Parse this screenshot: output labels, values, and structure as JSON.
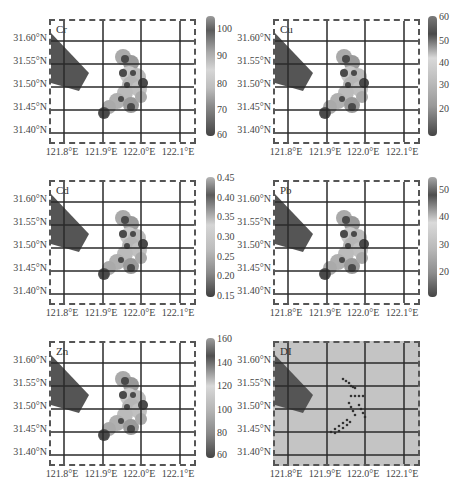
{
  "chart_data": [
    {
      "type": "heatmap",
      "panel_label": "Cr",
      "xlabel": "",
      "ylabel": "",
      "x_ticks": [
        "121.8°E",
        "121.9°E",
        "122.0°E",
        "122.1°E"
      ],
      "y_ticks": [
        "31.60°N",
        "31.55°N",
        "31.50°N",
        "31.45°N",
        "31.40°N"
      ],
      "colorbar": {
        "ticks": [
          "100",
          "90",
          "80",
          "70",
          "60"
        ],
        "range": [
          60,
          104
        ]
      }
    },
    {
      "type": "heatmap",
      "panel_label": "Cu",
      "x_ticks": [
        "121.8°E",
        "121.9°E",
        "122.0°E",
        "122.1°E"
      ],
      "y_ticks": [
        "31.60°N",
        "31.55°N",
        "31.50°N",
        "31.45°N",
        "31.40°N"
      ],
      "colorbar": {
        "ticks": [
          "60",
          "50",
          "40",
          "30",
          "20"
        ],
        "range": [
          15,
          60
        ]
      }
    },
    {
      "type": "heatmap",
      "panel_label": "Cd",
      "x_ticks": [
        "121.8°E",
        "121.9°E",
        "122.0°E",
        "122.1°E"
      ],
      "y_ticks": [
        "31.60°N",
        "31.55°N",
        "31.50°N",
        "31.45°N",
        "31.40°N"
      ],
      "colorbar": {
        "ticks": [
          "0.45",
          "0.40",
          "0.35",
          "0.30",
          "0.25",
          "0.20",
          "0.15"
        ],
        "range": [
          0.15,
          0.45
        ]
      }
    },
    {
      "type": "heatmap",
      "panel_label": "Pb",
      "x_ticks": [
        "121.8°E",
        "121.9°E",
        "122.0°E",
        "122.1°E"
      ],
      "y_ticks": [
        "31.60°N",
        "31.55°N",
        "31.50°N",
        "31.45°N",
        "31.40°N"
      ],
      "colorbar": {
        "ticks": [
          "50",
          "40",
          "30",
          "20"
        ],
        "range": [
          15,
          55
        ]
      }
    },
    {
      "type": "heatmap",
      "panel_label": "Zn",
      "x_ticks": [
        "121.8°E",
        "121.9°E",
        "122.0°E",
        "122.1°E"
      ],
      "y_ticks": [
        "31.60°N",
        "31.55°N",
        "31.50°N",
        "31.45°N",
        "31.40°N"
      ],
      "colorbar": {
        "ticks": [
          "160",
          "140",
          "120",
          "100",
          "80",
          "60"
        ],
        "range": [
          50,
          160
        ]
      }
    },
    {
      "type": "scatter",
      "panel_label": "DI",
      "x_ticks": [
        "121.8°E",
        "121.9°E",
        "122.0°E",
        "122.1°E"
      ],
      "y_ticks": [
        "31.60°N",
        "31.55°N",
        "31.50°N",
        "31.45°N",
        "31.40°N"
      ]
    }
  ],
  "panels": [
    {
      "label": "Cr",
      "cbar": [
        "100",
        "90",
        "80",
        "70",
        "60"
      ]
    },
    {
      "label": "Cu",
      "cbar": [
        "60",
        "50",
        "40",
        "30",
        "20"
      ]
    },
    {
      "label": "Cd",
      "cbar": [
        "0.45",
        "0.40",
        "0.35",
        "0.30",
        "0.25",
        "0.20",
        "0.15"
      ]
    },
    {
      "label": "Pb",
      "cbar": [
        "50",
        "40",
        "30",
        "20"
      ]
    },
    {
      "label": "Zn",
      "cbar": [
        "160",
        "140",
        "120",
        "100",
        "80",
        "60"
      ]
    },
    {
      "label": "DI"
    }
  ],
  "axes": {
    "x": [
      "121.8°E",
      "121.9°E",
      "122.0°E",
      "122.1°E"
    ],
    "y": [
      "31.60°N",
      "31.55°N",
      "31.50°N",
      "31.45°N",
      "31.40°N"
    ]
  },
  "colors": {
    "land": "#555555",
    "grid": "#2a2a2a",
    "di_bg": "#c4c4c4",
    "points": "#333333"
  }
}
